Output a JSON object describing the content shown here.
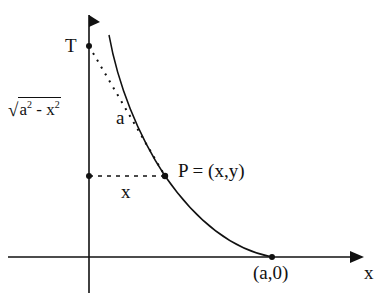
{
  "diagram": {
    "labels": {
      "T": "T",
      "sqrt_prefix": "√",
      "sqrt_a": "a",
      "sqrt_exp1": "2",
      "sqrt_minus": " - ",
      "sqrt_x": "x",
      "sqrt_exp2": "2",
      "segment_a": "a",
      "segment_x": "x",
      "P": "P = (x,y)",
      "a0": "(a,0)",
      "x_axis": "x"
    },
    "points": {
      "T": {
        "x": 89,
        "y": 46
      },
      "P": {
        "x": 165,
        "y": 176
      },
      "a0": {
        "x": 272,
        "y": 257
      },
      "y_axis_foot": {
        "x": 89,
        "y": 176
      }
    },
    "colors": {
      "ink": "#111111",
      "background": "#ffffff"
    }
  }
}
